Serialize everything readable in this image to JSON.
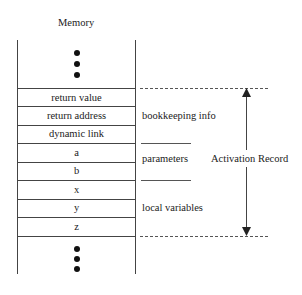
{
  "title": "Memory",
  "cells": [
    "return value",
    "return address",
    "dynamic link",
    "a",
    "b",
    "x",
    "y",
    "z"
  ],
  "labels": {
    "bookkeeping": "bookkeeping info",
    "parameters": "parameters",
    "locals": "local variables",
    "record": "Activation Record"
  },
  "ellipsis_top": "⋮",
  "ellipsis_bottom": "⋮"
}
